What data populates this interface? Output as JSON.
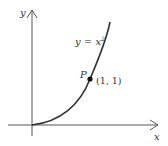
{
  "diagram": {
    "axes": {
      "x_label": "x",
      "y_label": "y"
    },
    "curve": {
      "equation_lhs": "y = x",
      "exponent": "2"
    },
    "point": {
      "name": "P",
      "coords": "(1, 1)"
    },
    "colors": {
      "axis": "#555555",
      "curve": "#333333",
      "point": "#111111",
      "text": "#333333"
    }
  }
}
